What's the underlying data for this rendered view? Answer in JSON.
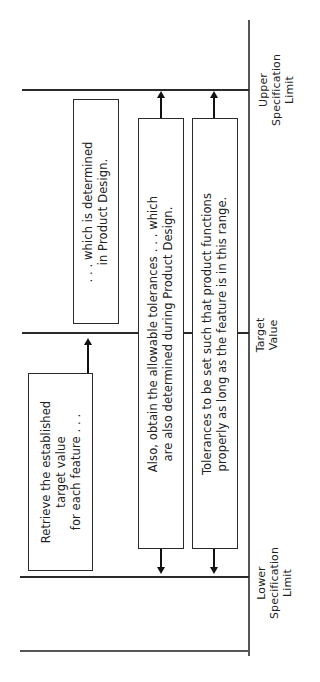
{
  "diagram": {
    "limits": {
      "upper": {
        "line1": "Upper",
        "line2": "Specification",
        "line3": "Limit"
      },
      "target": {
        "line1": "Target",
        "line2": "Value"
      },
      "lower": {
        "line1": "Lower",
        "line2": "Specification",
        "line3": "Limit"
      }
    },
    "boxes": {
      "retrieve": {
        "line1": "Retrieve the established",
        "line2": "target value",
        "line3": "for each feature . . ."
      },
      "determined": {
        "line1": ". . . which is determined",
        "line2": "in Product Design."
      },
      "allowable": {
        "line1": "Also, obtain the allowable tolerances . . . which",
        "line2": "are also determined during Product Design."
      },
      "tolerances": {
        "line1": "Tolerances to be set such that product functions",
        "line2": "properly as long as the feature is in this range."
      }
    },
    "colors": {
      "line": "#2a2a2a",
      "axis": "#555555",
      "background": "#ffffff"
    }
  }
}
